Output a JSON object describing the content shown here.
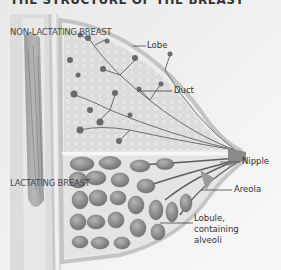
{
  "title": "THE STRUCTURE OF THE BREAST",
  "sections": {
    "upper": "NON-LACTATING BREAST",
    "lower": "LACTATING BREAST"
  },
  "labels": [
    {
      "id": "lobe",
      "text": "Lobe"
    },
    {
      "id": "duct",
      "text": "Duct"
    },
    {
      "id": "nipple",
      "text": "Nipple"
    },
    {
      "id": "areola",
      "text": "Areola"
    },
    {
      "id": "lobule_line1",
      "text": "Lobule,"
    },
    {
      "id": "lobule_line2",
      "text": "containing"
    },
    {
      "id": "lobule_line3",
      "text": "alveoli"
    }
  ],
  "colors": {
    "background": "#f4f4f4",
    "tissue": "#d8d8d8",
    "lobule": "#8a8a8a",
    "duct": "#6e6e6e",
    "muscle": "#9a9a9a",
    "label_text": "#333333"
  }
}
